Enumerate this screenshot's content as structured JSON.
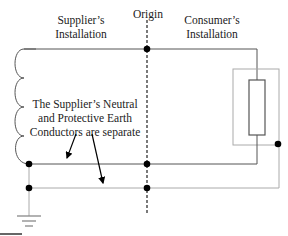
{
  "labels": {
    "supplier": [
      "Supplier’s",
      "Installation"
    ],
    "origin": "Origin",
    "consumer": [
      "Consumer’s",
      "Installation"
    ],
    "note": [
      "The Supplier’s Neutral",
      "and Protective Earth",
      "Conductors are separate"
    ]
  },
  "colors": {
    "line_dark": "#555555",
    "line_light": "#aaaaaa",
    "node": "#000000"
  }
}
